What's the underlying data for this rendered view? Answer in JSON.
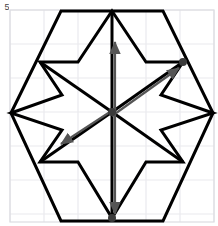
{
  "figure": {
    "title": "",
    "corner_label": "5",
    "canvas": {
      "width": 218,
      "height": 226,
      "background": "#ffffff"
    },
    "plot_area": {
      "x0": 10,
      "y0": 10,
      "x1": 214,
      "y1": 222
    },
    "grid": {
      "visible": true,
      "color": "#e9e9ee",
      "spacing": 34,
      "x_lines": [
        10,
        44,
        78,
        112,
        146,
        180,
        214
      ],
      "y_lines": [
        10,
        44,
        78,
        112,
        146,
        180,
        214,
        222
      ]
    },
    "center": {
      "x": 112,
      "y": 112
    },
    "colors": {
      "stroke_black": "#000000",
      "arrow_gray": "#555555",
      "grid_gray": "#e9e9ee",
      "border_gray": "#d8d8de"
    },
    "shapes": {
      "outer_hexagon": {
        "name": "outer-hexagon",
        "stroke": "#000000",
        "stroke_width": 3,
        "points": "11,113 61,11 163,11 213,113 163,221 61,221"
      },
      "star_polygon": {
        "name": "six-point-star-notched-polygon",
        "stroke": "#000000",
        "stroke_width": 3,
        "points": "112,11 146,62 183,62 163,96 213,113 163,130 183,162 146,162 112,218 78,162 40,162 61,130 11,113 61,96 40,62 78,62"
      },
      "spokes": {
        "name": "center-spokes",
        "stroke": "#000000",
        "stroke_width": 3,
        "lines": [
          {
            "x1": 112,
            "y1": 112,
            "x2": 112,
            "y2": 11
          },
          {
            "x1": 112,
            "y1": 112,
            "x2": 183,
            "y2": 62
          },
          {
            "x1": 112,
            "y1": 112,
            "x2": 183,
            "y2": 162
          },
          {
            "x1": 112,
            "y1": 112,
            "x2": 112,
            "y2": 218
          },
          {
            "x1": 112,
            "y1": 112,
            "x2": 40,
            "y2": 162
          },
          {
            "x1": 112,
            "y1": 112,
            "x2": 40,
            "y2": 62
          }
        ]
      }
    },
    "arrows": [
      {
        "name": "arrow-up",
        "color": "#555555",
        "x1": 112,
        "y1": 112,
        "x2": 112,
        "y2": 40,
        "label": ""
      },
      {
        "name": "arrow-up-right",
        "color": "#555555",
        "x1": 112,
        "y1": 112,
        "x2": 181,
        "y2": 63,
        "label": ""
      },
      {
        "name": "arrow-down-left",
        "color": "#555555",
        "x1": 112,
        "y1": 112,
        "x2": 57,
        "y2": 147,
        "label": ""
      },
      {
        "name": "arrow-down",
        "color": "#555555",
        "x1": 112,
        "y1": 112,
        "x2": 112,
        "y2": 216,
        "label": ""
      }
    ],
    "markers": [
      {
        "name": "marker-center",
        "x": 112,
        "y": 112,
        "r": 4,
        "color": "#3a3a3a"
      },
      {
        "name": "marker-top-right",
        "x": 183,
        "y": 62,
        "r": 4,
        "color": "#3a3a3a"
      },
      {
        "name": "marker-bottom",
        "x": 112,
        "y": 218,
        "r": 4,
        "color": "#3a3a3a"
      }
    ]
  }
}
